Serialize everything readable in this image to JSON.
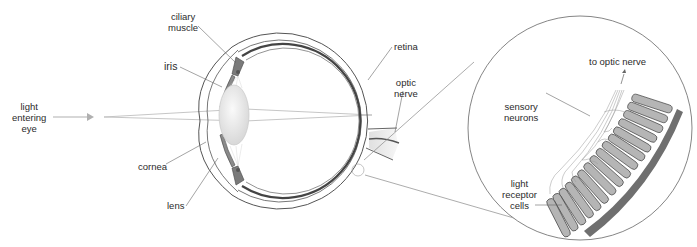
{
  "diagram": {
    "eye_labels": {
      "light_entering": [
        "light",
        "entering",
        "eye"
      ],
      "ciliary_muscle": [
        "ciliary",
        "muscle"
      ],
      "iris": "iris",
      "cornea": "cornea",
      "lens": "lens",
      "retina": "retina",
      "optic_nerve": [
        "optic",
        "nerve"
      ]
    },
    "inset_labels": {
      "to_optic_nerve": "to optic nerve",
      "sensory_neurons": [
        "sensory",
        "neurons"
      ],
      "light_receptor_cells": [
        "light",
        "receptor",
        "cells"
      ]
    },
    "colors": {
      "line": "#555555",
      "light_ray": "#aaaaaa",
      "arrow": "#b0b0b0",
      "muscle": "#7a7a7a",
      "receptor": "#b5b5b5",
      "pigment_layer": "#6f6f6f",
      "lens": "#e6e6e6"
    }
  }
}
